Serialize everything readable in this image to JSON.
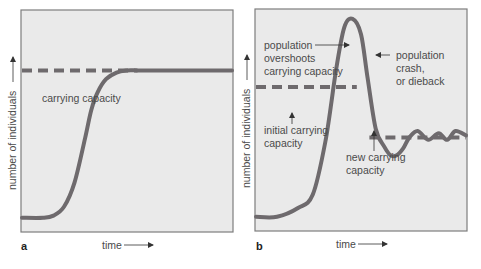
{
  "chart_data": [
    {
      "type": "line",
      "panel": "a",
      "title": "",
      "xlabel": "time",
      "ylabel": "number of individuals",
      "xlim": [
        0,
        100
      ],
      "ylim": [
        0,
        100
      ],
      "grid": false,
      "series": [
        {
          "name": "population",
          "style": "solid",
          "x": [
            0,
            10,
            15,
            20,
            25,
            30,
            33,
            36,
            40,
            45,
            50,
            55,
            60,
            100
          ],
          "y": [
            6,
            6,
            7,
            11,
            22,
            42,
            55,
            63,
            69,
            72,
            73,
            73,
            73,
            73
          ]
        },
        {
          "name": "carrying capacity",
          "style": "dashed",
          "x": [
            0,
            55
          ],
          "y": [
            73,
            73
          ]
        }
      ],
      "annotations": [
        {
          "text": "carrying capacity"
        }
      ]
    },
    {
      "type": "line",
      "panel": "b",
      "title": "",
      "xlabel": "time",
      "ylabel": "number of individuals",
      "xlim": [
        0,
        100
      ],
      "ylim": [
        0,
        100
      ],
      "grid": false,
      "series": [
        {
          "name": "population",
          "style": "solid",
          "x": [
            0,
            10,
            20,
            27,
            33,
            38,
            42,
            46,
            50,
            53,
            57,
            61,
            64,
            67,
            70,
            73,
            77,
            82,
            87,
            91,
            95,
            100
          ],
          "y": [
            6,
            6,
            10,
            16,
            40,
            72,
            92,
            96,
            89,
            70,
            46,
            38,
            34,
            34,
            37,
            42,
            45,
            41,
            44,
            41,
            45,
            43
          ],
          "note": "overshoot then crash, damped oscillation around new capacity"
        },
        {
          "name": "initial carrying capacity",
          "style": "dashed",
          "x": [
            0,
            48
          ],
          "y": [
            65,
            65
          ]
        },
        {
          "name": "new carrying capacity",
          "style": "dashed",
          "x": [
            54,
            100
          ],
          "y": [
            42,
            42
          ]
        }
      ],
      "annotations": [
        {
          "text": "population overshoots carrying capacity",
          "lines": [
            "population",
            "overshoots",
            "carrying capacity"
          ]
        },
        {
          "text": "population crash, or dieback",
          "lines": [
            "population",
            "crash,",
            "or dieback"
          ]
        },
        {
          "text": "initial carrying capacity",
          "lines": [
            "initial carrying",
            "capacity"
          ]
        },
        {
          "text": "new carrying capacity",
          "lines": [
            "new carrying",
            "capacity"
          ]
        }
      ]
    }
  ],
  "labels": {
    "panel_a": "a",
    "panel_b": "b",
    "time": "time",
    "ylabel": "number of individuals",
    "cc": "carrying capacity",
    "b_over_1": "population",
    "b_over_2": "overshoots",
    "b_over_3": "carrying capacity",
    "b_crash_1": "population",
    "b_crash_2": "crash,",
    "b_crash_3": "or dieback",
    "b_init_1": "initial carrying",
    "b_init_2": "capacity",
    "b_new_1": "new carrying",
    "b_new_2": "capacity"
  },
  "colors": {
    "curve": "#6e6a6d",
    "frame": "#7d7d7d",
    "plot_bg": "#eaeaea",
    "text": "#4a4a4a"
  }
}
